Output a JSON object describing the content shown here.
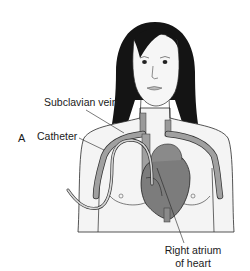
{
  "figure": {
    "panel_letter": "A",
    "labels": {
      "subclavian_vein": "Subclavian vein",
      "catheter": "Catheter",
      "right_atrium_line1": "Right atrium",
      "right_atrium_line2": "of heart"
    },
    "colors": {
      "hair": "#111111",
      "skin": "#f2f2f2",
      "outline": "#2a2a2a",
      "vessel": "#9a9a9a",
      "heart": "#7a7a7a",
      "catheter": "#d0d0d0"
    }
  }
}
